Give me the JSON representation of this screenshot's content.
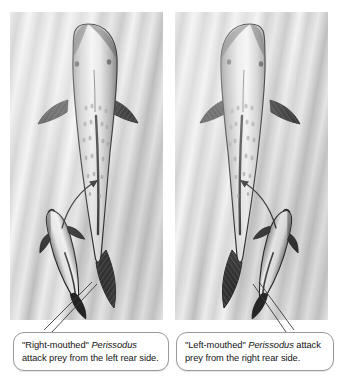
{
  "figure": {
    "panels": [
      {
        "id": "left",
        "name": "right-mouthed-panel",
        "large_fish_label": "prey fish dorsal view",
        "small_fish_label": "scale-eating fish",
        "arrow_label": "attack approach arrow",
        "caption": {
          "quoted_term": "\"Right-mouthed\"",
          "genus": "Perissodus",
          "rest": " attack prey from the left rear side.",
          "full_text": "\"Right-mouthed\" Perissodus attack prey from the left rear side."
        }
      },
      {
        "id": "right",
        "name": "left-mouthed-panel",
        "large_fish_label": "prey fish dorsal view",
        "small_fish_label": "scale-eating fish",
        "arrow_label": "attack approach arrow",
        "caption": {
          "quoted_term": "\"Left-mouthed\"",
          "genus": "Perissodus",
          "rest": " attack prey from the right rear side.",
          "full_text": "\"Left-mouthed\" Perissodus attack prey from the right rear side."
        }
      }
    ]
  },
  "colors": {
    "page_background": "#ffffff",
    "panel_light": "#ededed",
    "panel_mid": "#cfcfcf",
    "panel_dark": "#c6c6c6",
    "fish_outline": "#1a1a1a",
    "fin_dark": "#2a2a2a",
    "callout_border": "#9a9a9a",
    "callout_fill": "#ffffff",
    "text": "#141414"
  }
}
